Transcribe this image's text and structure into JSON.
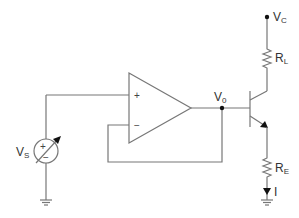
{
  "diagram": {
    "type": "circuit-schematic",
    "colors": {
      "wire": "#777777",
      "text": "#333333",
      "node": "#111111",
      "background": "#ffffff"
    },
    "labels": {
      "vs": {
        "main": "V",
        "sub": "S"
      },
      "vo": {
        "main": "V",
        "sub": "0"
      },
      "vc": {
        "main": "V",
        "sub": "C"
      },
      "rl": {
        "main": "R",
        "sub": "L"
      },
      "re": {
        "main": "R",
        "sub": "E"
      },
      "current": "I"
    },
    "opamp": {
      "plus": "+",
      "minus": "−"
    },
    "source": {
      "plus": "+",
      "minus": "−"
    },
    "components": [
      "variable-voltage-source-Vs",
      "op-amp",
      "npn-transistor",
      "resistor-RL",
      "resistor-RE",
      "ground-source",
      "ground-emitter"
    ]
  }
}
